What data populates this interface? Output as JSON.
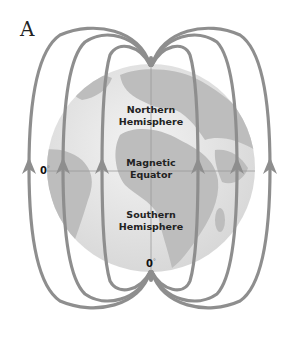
{
  "figure": {
    "panel_letter": "A",
    "labels": {
      "northern_1": "Northern",
      "northern_2": "Hemisphere",
      "equator_1": "Magnetic",
      "equator_2": "Equator",
      "southern_1": "Southern",
      "southern_2": "Hemisphere",
      "deg_left": "0",
      "deg_bottom": "0",
      "deg_symbol": "°"
    },
    "colors": {
      "field_line": "#8e8e8e",
      "globe_ocean": "#e9e9e9",
      "globe_land": "#bdbdbd",
      "text": "#222222"
    },
    "field_line_count": 6,
    "field_direction": "upward (south to north)"
  }
}
